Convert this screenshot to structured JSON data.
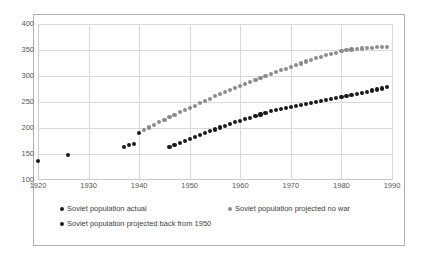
{
  "chart_data": {
    "type": "scatter",
    "title": "",
    "xlabel": "",
    "ylabel": "",
    "xlim": [
      1920,
      1990
    ],
    "ylim": [
      100,
      400
    ],
    "xticks": [
      1920,
      1930,
      1940,
      1950,
      1960,
      1970,
      1980,
      1990
    ],
    "yticks": [
      100,
      150,
      200,
      250,
      300,
      350,
      400
    ],
    "grid": true,
    "legend_position": "bottom",
    "series": [
      {
        "name": "Soviet population actual",
        "color": "#1a1a1a",
        "marker": "circle",
        "points": [
          [
            1920,
            137
          ],
          [
            1926,
            148
          ],
          [
            1937,
            164
          ],
          [
            1938,
            167
          ],
          [
            1939,
            170
          ],
          [
            1940,
            191
          ]
        ]
      },
      {
        "name": "Soviet population projected no war",
        "color": "#8c8c8c",
        "marker": "circle",
        "points": [
          [
            1941,
            196
          ],
          [
            1942,
            201
          ],
          [
            1943,
            206
          ],
          [
            1944,
            211
          ],
          [
            1945,
            216
          ],
          [
            1946,
            221
          ],
          [
            1947,
            225
          ],
          [
            1948,
            230
          ],
          [
            1949,
            234
          ],
          [
            1950,
            239
          ],
          [
            1951,
            243
          ],
          [
            1952,
            248
          ],
          [
            1953,
            252
          ],
          [
            1954,
            256
          ],
          [
            1955,
            261
          ],
          [
            1956,
            265
          ],
          [
            1957,
            269
          ],
          [
            1958,
            273
          ],
          [
            1959,
            277
          ],
          [
            1960,
            281
          ],
          [
            1961,
            285
          ],
          [
            1962,
            289
          ],
          [
            1963,
            293
          ],
          [
            1964,
            296
          ],
          [
            1965,
            300
          ],
          [
            1966,
            304
          ],
          [
            1967,
            307
          ],
          [
            1968,
            311
          ],
          [
            1969,
            314
          ],
          [
            1970,
            318
          ],
          [
            1971,
            321
          ],
          [
            1972,
            324
          ],
          [
            1973,
            328
          ],
          [
            1974,
            331
          ],
          [
            1975,
            334
          ],
          [
            1976,
            337
          ],
          [
            1977,
            340
          ],
          [
            1978,
            343
          ],
          [
            1979,
            345
          ],
          [
            1980,
            348
          ],
          [
            1981,
            350
          ],
          [
            1982,
            351
          ],
          [
            1983,
            352
          ],
          [
            1984,
            353
          ],
          [
            1985,
            354
          ],
          [
            1986,
            354
          ],
          [
            1987,
            355
          ],
          [
            1988,
            355
          ],
          [
            1989,
            356
          ]
        ]
      },
      {
        "name": "Soviet population projected back from 1950",
        "color": "#1a1a1a",
        "marker": "circle",
        "points": [
          [
            1946,
            163
          ],
          [
            1947,
            167
          ],
          [
            1948,
            171
          ],
          [
            1949,
            175
          ],
          [
            1950,
            179
          ],
          [
            1951,
            183
          ],
          [
            1952,
            187
          ],
          [
            1953,
            190
          ],
          [
            1954,
            194
          ],
          [
            1955,
            197
          ],
          [
            1956,
            201
          ],
          [
            1957,
            204
          ],
          [
            1958,
            208
          ],
          [
            1959,
            211
          ],
          [
            1960,
            214
          ],
          [
            1961,
            217
          ],
          [
            1962,
            220
          ],
          [
            1963,
            223
          ],
          [
            1964,
            226
          ],
          [
            1965,
            229
          ],
          [
            1966,
            232
          ],
          [
            1967,
            234
          ],
          [
            1968,
            236
          ],
          [
            1969,
            238
          ],
          [
            1970,
            240
          ],
          [
            1971,
            242
          ],
          [
            1972,
            244
          ],
          [
            1973,
            246
          ],
          [
            1974,
            248
          ],
          [
            1975,
            250
          ],
          [
            1976,
            252
          ],
          [
            1977,
            254
          ],
          [
            1978,
            256
          ],
          [
            1979,
            258
          ],
          [
            1980,
            260
          ],
          [
            1981,
            262
          ],
          [
            1982,
            264
          ],
          [
            1983,
            266
          ],
          [
            1984,
            268
          ],
          [
            1985,
            270
          ],
          [
            1986,
            272
          ],
          [
            1987,
            274
          ],
          [
            1988,
            276
          ],
          [
            1989,
            279
          ]
        ]
      }
    ]
  },
  "legend": {
    "entries": [
      {
        "label": "Soviet population actual",
        "color": "#1a1a1a"
      },
      {
        "label": "Soviet population projected no war",
        "color": "#8c8c8c"
      },
      {
        "label": "Soviet population projected back from 1950",
        "color": "#1a1a1a"
      }
    ]
  }
}
